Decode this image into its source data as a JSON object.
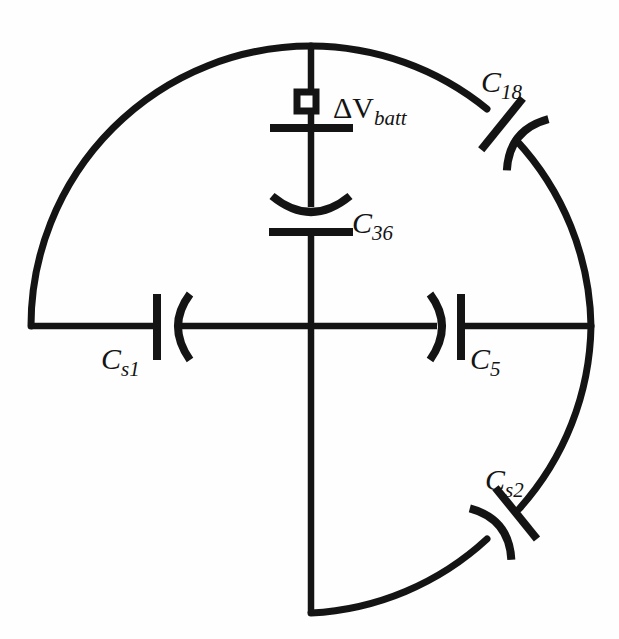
{
  "diagram": {
    "kind": "circuit-schematic",
    "background_color": "#fefefe",
    "line_color": "#141414",
    "canvas": {
      "width": 619,
      "height": 639
    },
    "geometry": {
      "center_x": 311,
      "center_y": 326,
      "radius": 281,
      "arcs_present": [
        "top-left",
        "top-right",
        "bottom-right"
      ],
      "arc_absent": [
        "bottom-left"
      ]
    },
    "components": [
      {
        "id": "battery",
        "label": "ΔV",
        "subscript": "batt",
        "symbol": "battery-cell",
        "orientation": "vertical",
        "branch": "center-vertical-upper",
        "label_x": 333,
        "label_y": 118
      },
      {
        "id": "c36",
        "label": "C",
        "subscript": "36",
        "symbol": "capacitor-curved-plate",
        "orientation": "vertical",
        "branch": "center-vertical-upper",
        "label_x": 352,
        "label_y": 233
      },
      {
        "id": "c18",
        "label": "C",
        "subscript": "18",
        "symbol": "capacitor-curved-plate",
        "orientation": "arc-tangent",
        "branch": "top-right-arc",
        "label_x": 481,
        "label_y": 92
      },
      {
        "id": "cs1",
        "label": "C",
        "subscript": "s1",
        "symbol": "capacitor-curved-plate",
        "orientation": "horizontal",
        "branch": "left-horizontal",
        "label_x": 101,
        "label_y": 369
      },
      {
        "id": "c5",
        "label": "C",
        "subscript": "5",
        "symbol": "capacitor-curved-plate",
        "orientation": "horizontal",
        "branch": "right-horizontal",
        "label_x": 470,
        "label_y": 369
      },
      {
        "id": "cs2",
        "label": "C",
        "subscript": "s2",
        "symbol": "capacitor-curved-plate",
        "orientation": "arc-tangent",
        "branch": "bottom-right-arc",
        "label_x": 485,
        "label_y": 490
      }
    ],
    "labels": {
      "battery": {
        "main": "ΔV",
        "sub": "batt"
      },
      "c36": {
        "main": "C",
        "sub": "36"
      },
      "c18": {
        "main": "C",
        "sub": "18"
      },
      "cs1": {
        "main": "C",
        "sub": "s1"
      },
      "c5": {
        "main": "C",
        "sub": "5"
      },
      "cs2": {
        "main": "C",
        "sub": "s2"
      }
    }
  }
}
